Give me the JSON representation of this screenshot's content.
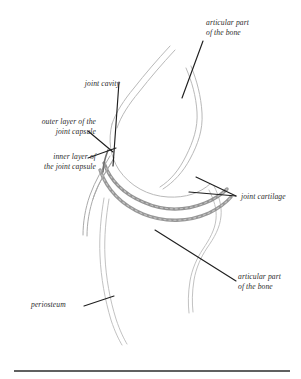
{
  "figure": {
    "type": "anatomical-illustration",
    "background_color": "#ffffff",
    "ink_color": "#2b2b2b",
    "bone_outline_color": "#b9b9b9",
    "cartilage_color": "#8a8a8a",
    "leader_line_color": "#1f1f1f",
    "rule_color": "#2b2b2b",
    "labels": {
      "articular_part_top_line1": "articular part",
      "articular_part_top_line2": "of the bone",
      "joint_cavity": "joint cavity",
      "outer_layer_line1": "outer layer of the",
      "outer_layer_line2": "joint capsule",
      "inner_layer_line1": "inner layer of",
      "inner_layer_line2": "the joint capsule",
      "joint_cartilage": "joint cartilage",
      "articular_part_bottom_line1": "articular part",
      "articular_part_bottom_line2": "of the bone",
      "periosteum": "periosteum"
    }
  }
}
